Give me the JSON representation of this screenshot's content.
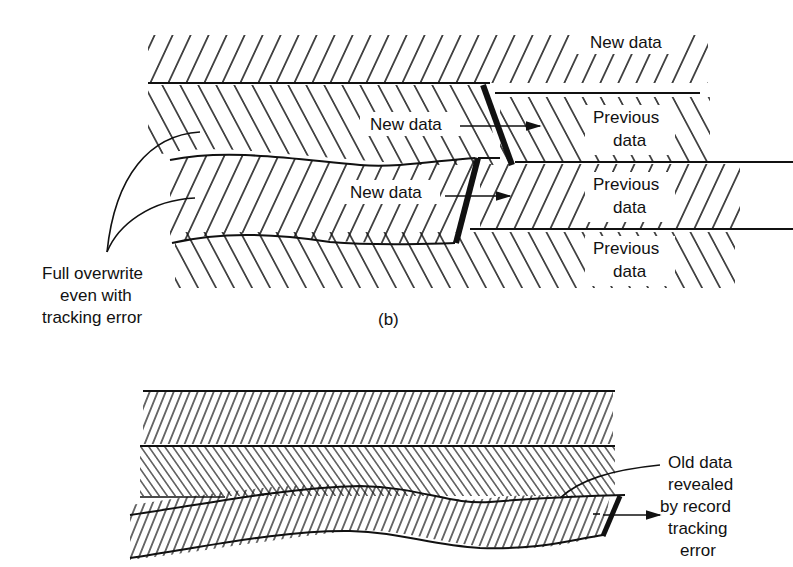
{
  "figure_b": {
    "caption": "(b)",
    "labels": {
      "new_data_top_right": "New data",
      "new_data_upper": "New data",
      "new_data_lower": "New data",
      "previous_data_1_line1": "Previous",
      "previous_data_1_line2": "data",
      "previous_data_2_line1": "Previous",
      "previous_data_2_line2": "data",
      "previous_data_3_line1": "Previous",
      "previous_data_3_line2": "data"
    },
    "annotation": {
      "line1": "Full overwrite",
      "line2": "even with",
      "line3": "tracking error"
    }
  },
  "figure_c": {
    "annotation": {
      "line1": "Old data",
      "line2": "revealed",
      "line3": "by record",
      "line4": "tracking",
      "line5": "error"
    }
  },
  "colors": {
    "ink": "#111111",
    "background": "#ffffff"
  }
}
